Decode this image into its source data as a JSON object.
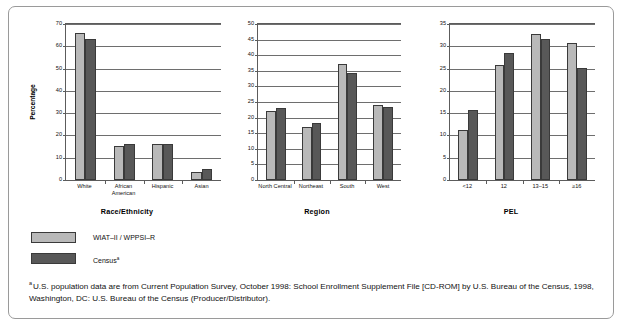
{
  "figure": {
    "legend": [
      {
        "label": "WIAT–II / WPPSI–R",
        "swatch": "light",
        "color": "#b9b9b9"
      },
      {
        "label": "Census",
        "superscript": "a",
        "swatch": "dark",
        "color": "#585858"
      }
    ],
    "footnote": {
      "marker": "a",
      "text": "U.S. population data are from Current Population Survey, October 1998: School Enrollment Supplement File [CD-ROM] by U.S. Bureau of the Census, 1998, Washington, DC: U.S. Bureau of the Census (Producer/Distributor)."
    }
  },
  "chart_data": [
    {
      "type": "bar",
      "title": "",
      "xlabel": "Race/Ethnicity",
      "ylabel": "Percentage",
      "ylim": [
        0,
        70
      ],
      "yticks": [
        0,
        10,
        20,
        30,
        40,
        50,
        60,
        70
      ],
      "grid": true,
      "legend_position": "below-figure",
      "categories": [
        "White",
        "African American",
        "Hispanic",
        "Asian"
      ],
      "series": [
        {
          "name": "WIAT–II / WPPSI–R",
          "color": "#b9b9b9",
          "values": [
            66.0,
            15.2,
            16.2,
            3.8
          ]
        },
        {
          "name": "Census",
          "color": "#585858",
          "values": [
            63.2,
            16.0,
            16.1,
            4.8
          ]
        }
      ]
    },
    {
      "type": "bar",
      "title": "",
      "xlabel": "Region",
      "ylabel": "",
      "ylim": [
        0,
        50
      ],
      "yticks": [
        0,
        5,
        10,
        15,
        20,
        25,
        30,
        35,
        40,
        45,
        50
      ],
      "grid": true,
      "legend_position": "below-figure",
      "categories": [
        "North Central",
        "Northeast",
        "South",
        "West"
      ],
      "series": [
        {
          "name": "WIAT–II / WPPSI–R",
          "color": "#b9b9b9",
          "values": [
            22.0,
            17.0,
            37.1,
            24.1
          ]
        },
        {
          "name": "Census",
          "color": "#585858",
          "values": [
            23.2,
            18.3,
            34.2,
            23.3
          ]
        }
      ]
    },
    {
      "type": "bar",
      "title": "",
      "xlabel": "PEL",
      "ylabel": "",
      "ylim": [
        0,
        35
      ],
      "yticks": [
        0,
        5,
        10,
        15,
        20,
        25,
        30,
        35
      ],
      "grid": true,
      "legend_position": "below-figure",
      "categories": [
        "<12",
        "12",
        "13–15",
        "≥16"
      ],
      "series": [
        {
          "name": "WIAT–II / WPPSI–R",
          "color": "#b9b9b9",
          "values": [
            11.2,
            25.7,
            32.8,
            30.7
          ]
        },
        {
          "name": "Census",
          "color": "#585858",
          "values": [
            15.7,
            28.5,
            31.6,
            25.1
          ]
        }
      ]
    }
  ]
}
